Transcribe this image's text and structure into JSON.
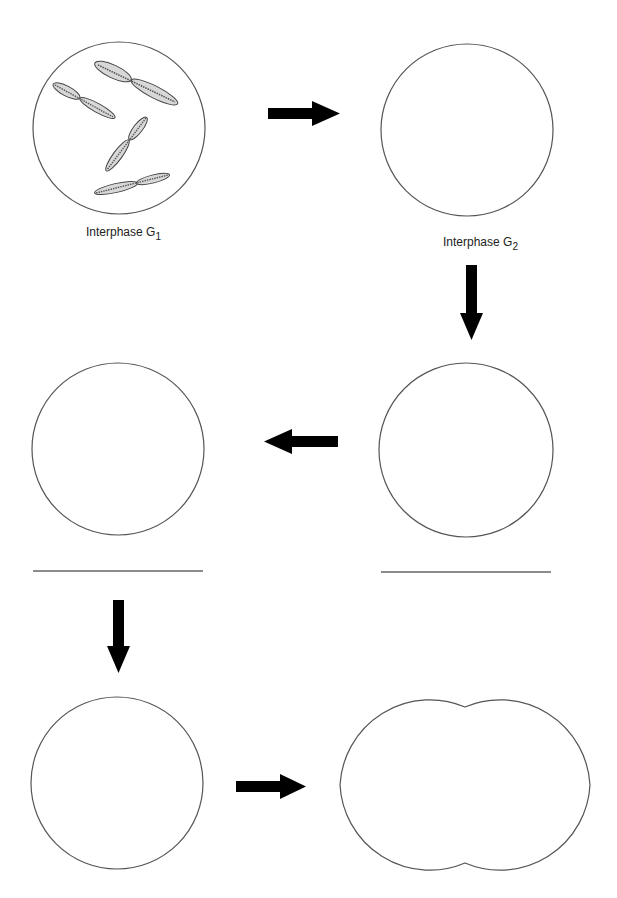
{
  "diagram": {
    "type": "cell-cycle worksheet (mitosis stages)",
    "colors": {
      "outline": "#555555",
      "arrow": "#000000",
      "chromosome_fill": "#d8d8d8",
      "answer_line": "#666666"
    },
    "stages": [
      {
        "id": "g1",
        "label_main": "Interphase G",
        "label_sub": "1",
        "shape": "circle",
        "cx": 119,
        "cy": 128,
        "r": 86,
        "has_chromosomes": true
      },
      {
        "id": "g2",
        "label_main": "Interphase G",
        "label_sub": "2",
        "shape": "circle",
        "cx": 467,
        "cy": 130,
        "r": 86
      },
      {
        "id": "stage3",
        "label_main": "",
        "label_sub": "",
        "shape": "circle",
        "cx": 466,
        "cy": 450,
        "r": 87,
        "answer_line": true
      },
      {
        "id": "stage4",
        "label_main": "",
        "label_sub": "",
        "shape": "circle",
        "cx": 118,
        "cy": 449,
        "r": 86,
        "answer_line": true
      },
      {
        "id": "stage5",
        "label_main": "",
        "label_sub": "",
        "shape": "circle",
        "cx": 117,
        "cy": 783,
        "r": 86
      },
      {
        "id": "stage6",
        "label_main": "",
        "label_sub": "",
        "shape": "dividing-cell",
        "cx": 465,
        "cy": 785
      }
    ],
    "arrows": [
      {
        "from": "g1",
        "to": "g2",
        "direction": "right"
      },
      {
        "from": "g2",
        "to": "stage3",
        "direction": "down"
      },
      {
        "from": "stage3",
        "to": "stage4",
        "direction": "left"
      },
      {
        "from": "stage4",
        "to": "stage5",
        "direction": "down"
      },
      {
        "from": "stage5",
        "to": "stage6",
        "direction": "right"
      }
    ],
    "chromosome_count": 4
  }
}
